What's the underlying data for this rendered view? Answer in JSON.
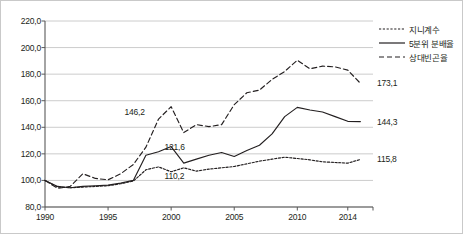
{
  "chart_data": {
    "type": "line",
    "title": "",
    "xlabel": "",
    "ylabel": "",
    "xlim": [
      1990,
      2016
    ],
    "ylim": [
      80.0,
      220.0
    ],
    "ytick_step": 20,
    "grid": true,
    "legend_position": "top-right",
    "decimal_separator": ",",
    "x": [
      1990,
      1991,
      1992,
      1993,
      1994,
      1995,
      1996,
      1997,
      1998,
      1999,
      2000,
      2001,
      2002,
      2003,
      2004,
      2005,
      2006,
      2007,
      2008,
      2009,
      2010,
      2011,
      2012,
      2013,
      2014,
      2015
    ],
    "yticks": [
      "80,0",
      "100,0",
      "120,0",
      "140,0",
      "160,0",
      "180,0",
      "200,0",
      "220,0"
    ],
    "xticks": [
      "1990",
      "1995",
      "2000",
      "2005",
      "2010",
      "2014"
    ],
    "series": [
      {
        "name": "지니계수",
        "style": "dotted",
        "color": "#231f20",
        "values": [
          100.0,
          95.0,
          94.5,
          95.0,
          95.5,
          96.0,
          97.5,
          99.5,
          108.0,
          110.2,
          106.5,
          109.5,
          107.0,
          108.5,
          109.5,
          110.5,
          112.5,
          114.5,
          116.0,
          117.5,
          116.5,
          115.5,
          114.0,
          113.5,
          113.0,
          115.8
        ],
        "point_labels": [
          {
            "x": 1999,
            "label": "110,2"
          }
        ],
        "end_label": "115,8"
      },
      {
        "name": "5분위 분배율",
        "style": "solid",
        "color": "#231f20",
        "values": [
          100.0,
          95.5,
          94.5,
          95.5,
          96.0,
          96.5,
          98.0,
          100.0,
          119.0,
          121.6,
          125.5,
          113.0,
          116.0,
          119.0,
          121.0,
          118.0,
          122.5,
          126.5,
          135.0,
          148.0,
          155.0,
          153.0,
          151.5,
          148.0,
          144.5,
          144.3
        ],
        "point_labels": [
          {
            "x": 1999,
            "label": "121,6"
          }
        ],
        "end_label": "144,3"
      },
      {
        "name": "상대빈곤율",
        "style": "dashed",
        "color": "#231f20",
        "values": [
          100.0,
          94.0,
          95.5,
          105.0,
          101.5,
          100.5,
          105.0,
          112.0,
          125.0,
          146.2,
          155.5,
          136.0,
          142.0,
          140.5,
          142.0,
          157.0,
          166.0,
          168.0,
          176.0,
          182.0,
          190.5,
          184.0,
          186.0,
          185.5,
          183.0,
          173.1
        ],
        "point_labels": [
          {
            "x": 1999,
            "label": "146,2"
          }
        ],
        "end_label": "173,1"
      }
    ]
  },
  "legend": {
    "items": [
      {
        "label": "지니계수"
      },
      {
        "label": "5분위 분배율"
      },
      {
        "label": "상대빈곤율"
      }
    ]
  }
}
